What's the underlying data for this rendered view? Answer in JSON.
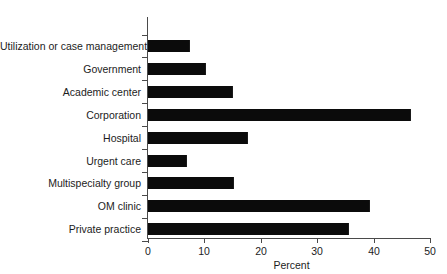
{
  "chart_data": {
    "type": "bar",
    "orientation": "horizontal",
    "title": "",
    "xlabel": "Percent",
    "ylabel": "",
    "xlim": [
      0,
      50
    ],
    "xticks": [
      0,
      10,
      20,
      30,
      40,
      50
    ],
    "grid": false,
    "legend": false,
    "bar_color": "#0b0b0b",
    "axis_color": "#4a4a4a",
    "categories": [
      "Utilization or case management",
      "Government",
      "Academic center",
      "Corporation",
      "Hospital",
      "Urgent care",
      "Multispecialty group",
      "OM clinic",
      "Private practice"
    ],
    "values": [
      7.3,
      10.1,
      14.9,
      46.5,
      17.6,
      6.7,
      15.1,
      39.2,
      35.5
    ]
  }
}
